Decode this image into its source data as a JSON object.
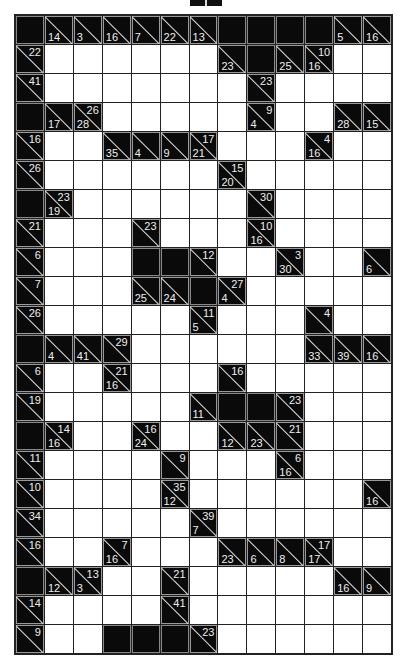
{
  "puzzle": {
    "type": "kakuro",
    "cols": 13,
    "rows_count": 22,
    "legend": {
      "W": "white entry cell",
      "B": "black blocked cell",
      "a/d": "clue cell: across-sum / down-sum"
    },
    "rows": [
      [
        "B",
        "/14",
        "/3",
        "/16",
        "/7",
        "/22",
        "/13",
        "B",
        "B",
        "B",
        "B",
        "/5",
        "/16"
      ],
      [
        "22/",
        "W",
        "W",
        "W",
        "W",
        "W",
        "W",
        "/23",
        "B",
        "/25",
        "10/16",
        "W",
        "W"
      ],
      [
        "41/",
        "W",
        "W",
        "W",
        "W",
        "W",
        "W",
        "W",
        "23/",
        "W",
        "W",
        "W",
        "W"
      ],
      [
        "B",
        "/17",
        "26/28",
        "W",
        "W",
        "W",
        "W",
        "W",
        "9/4",
        "W",
        "W",
        "/28",
        "/15"
      ],
      [
        "16/",
        "W",
        "W",
        "/35",
        "/4",
        "/9",
        "17/21",
        "W",
        "W",
        "W",
        "4/16",
        "W",
        "W"
      ],
      [
        "26/",
        "W",
        "W",
        "W",
        "W",
        "W",
        "W",
        "15/20",
        "W",
        "W",
        "W",
        "W",
        "W"
      ],
      [
        "B",
        "23/19",
        "W",
        "W",
        "W",
        "W",
        "W",
        "W",
        "30/",
        "W",
        "W",
        "W",
        "W"
      ],
      [
        "21/",
        "W",
        "W",
        "W",
        "23/",
        "W",
        "W",
        "W",
        "10/16",
        "W",
        "W",
        "W",
        "W"
      ],
      [
        "6/",
        "W",
        "W",
        "W",
        "B",
        "B",
        "12/",
        "W",
        "W",
        "3/30",
        "W",
        "W",
        "/6"
      ],
      [
        "7/",
        "W",
        "W",
        "W",
        "/25",
        "/24",
        "B",
        "27/4",
        "W",
        "W",
        "W",
        "W",
        "W"
      ],
      [
        "26/",
        "W",
        "W",
        "W",
        "W",
        "W",
        "11/5",
        "W",
        "W",
        "W",
        "4/",
        "W",
        "W"
      ],
      [
        "B",
        "/4",
        "/41",
        "29/",
        "W",
        "W",
        "W",
        "W",
        "W",
        "W",
        "/33",
        "/39",
        "/16"
      ],
      [
        "6/",
        "W",
        "W",
        "21/16",
        "W",
        "W",
        "W",
        "16/",
        "W",
        "W",
        "W",
        "W",
        "W"
      ],
      [
        "19/",
        "W",
        "W",
        "W",
        "W",
        "W",
        "/11",
        "B",
        "B",
        "23/",
        "W",
        "W",
        "W"
      ],
      [
        "B",
        "14/16",
        "W",
        "W",
        "16/24",
        "W",
        "W",
        "/12",
        "/23",
        "21/",
        "W",
        "W",
        "W"
      ],
      [
        "11/",
        "W",
        "W",
        "W",
        "W",
        "9/",
        "W",
        "W",
        "W",
        "6/16",
        "W",
        "W",
        "W"
      ],
      [
        "10/",
        "W",
        "W",
        "W",
        "W",
        "35/12",
        "W",
        "W",
        "W",
        "W",
        "W",
        "W",
        "/16"
      ],
      [
        "34/",
        "W",
        "W",
        "W",
        "W",
        "W",
        "39/7",
        "W",
        "W",
        "W",
        "W",
        "W",
        "W"
      ],
      [
        "16/",
        "W",
        "W",
        "7/16",
        "W",
        "W",
        "W",
        "/23",
        "/6",
        "/8",
        "17/17",
        "W",
        "W"
      ],
      [
        "B",
        "/12",
        "13/3",
        "W",
        "W",
        "21/",
        "W",
        "W",
        "W",
        "W",
        "W",
        "/16",
        "/9"
      ],
      [
        "14/",
        "W",
        "W",
        "W",
        "W",
        "41/",
        "W",
        "W",
        "W",
        "W",
        "W",
        "W",
        "W"
      ],
      [
        "9/",
        "W",
        "W",
        "B",
        "B",
        "B",
        "23/",
        "W",
        "W",
        "W",
        "W",
        "W",
        "W"
      ]
    ]
  },
  "colors": {
    "block": "#0a0a0a",
    "white": "#ffffff",
    "grid_line": "#222222",
    "clue_text": "#eeeeee"
  }
}
